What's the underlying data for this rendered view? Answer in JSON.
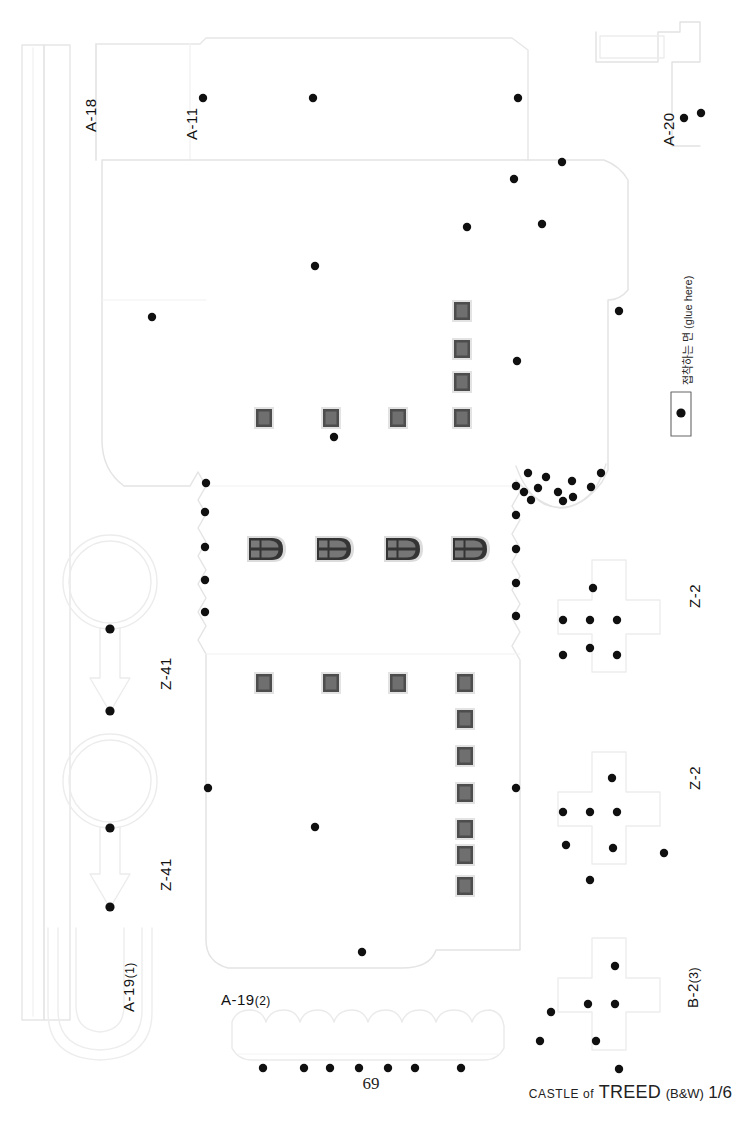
{
  "sheet": {
    "width": 742,
    "height": 1128,
    "background": "#ffffff",
    "page_number": "69"
  },
  "footer": {
    "credit_prefix": "CASTLE of",
    "credit_title": "TREED",
    "credit_variant": "(B&W)",
    "credit_sheet": "1/6"
  },
  "glue_note": {
    "text": "접착하는 면 (glue here)",
    "latin": "(glue here)"
  },
  "labels": [
    {
      "id": "a-18",
      "text": "A-18",
      "sub": "",
      "x": 74,
      "y": 108,
      "rotated": true
    },
    {
      "id": "a-11",
      "text": "A-11",
      "sub": "",
      "x": 176,
      "y": 140,
      "rotated": true
    },
    {
      "id": "a-20",
      "text": "A-20",
      "sub": "",
      "x": 655,
      "y": 142,
      "rotated": true
    },
    {
      "id": "z-41-top",
      "text": "Z-41",
      "sub": "",
      "x": 152,
      "y": 690,
      "rotated": true
    },
    {
      "id": "z-41-bot",
      "text": "Z-41",
      "sub": "",
      "x": 152,
      "y": 895,
      "rotated": true
    },
    {
      "id": "z-2-top",
      "text": "Z-2",
      "sub": "",
      "x": 682,
      "y": 608,
      "rotated": true
    },
    {
      "id": "z-2-bot",
      "text": "Z-2",
      "sub": "",
      "x": 682,
      "y": 790,
      "rotated": true
    },
    {
      "id": "b-2-3",
      "text": "B-2",
      "sub": "(3)",
      "x": 680,
      "y": 1010,
      "rotated": true
    },
    {
      "id": "a-19-1",
      "text": "A-19",
      "sub": "(1)",
      "x": 116,
      "y": 1010,
      "rotated": true
    },
    {
      "id": "a-19-2",
      "text": "A-19",
      "sub": "(2)",
      "x": 221,
      "y": 1002,
      "rotated": false
    }
  ],
  "colors": {
    "cut_line": "#e8e8e8",
    "fold_line": "#f0f0f0",
    "dot": "#101010",
    "window_frame": "#e0e0e0",
    "window_border": "#4a4a4a",
    "window_fill": "#6e6e6e",
    "arch_outer": "#d8d8d8",
    "arch_body": "#3a3a3a",
    "arch_pane": "#707070",
    "glue_box_border": "#555555",
    "text": "#111111"
  },
  "pieces": [
    {
      "name": "A-18",
      "kind": "long-strip",
      "note": "tall narrow vertical strip, left edge"
    },
    {
      "name": "A-11",
      "kind": "tall-panel",
      "note": "upper tall panel with rounded top-left corner"
    },
    {
      "name": "A-20",
      "kind": "small-tab",
      "note": "small bracket tab, top right"
    },
    {
      "name": "main",
      "kind": "body-panel",
      "note": "large castle wall unroll with notched left edge and scalloped right cutout"
    },
    {
      "name": "Z-41",
      "kind": "ring-arrow",
      "note": "circle ring joined to downward arrow, two copies"
    },
    {
      "name": "Z-2",
      "kind": "cross",
      "note": "plus/cross shaped piece, two copies"
    },
    {
      "name": "B-2(3)",
      "kind": "cross",
      "note": "plus/cross shaped piece, lower right"
    },
    {
      "name": "A-19(1)",
      "kind": "u-shape",
      "note": "U shaped band, lower left"
    },
    {
      "name": "A-19(2)",
      "kind": "scallop-strip",
      "note": "horizontal scalloped crenellation strip"
    }
  ],
  "window_counts": {
    "square_windows": 17,
    "arched_windows": 4,
    "glue_dots_total": 78
  },
  "square_windows": [
    {
      "x": 462,
      "y": 300
    },
    {
      "x": 462,
      "y": 340
    },
    {
      "x": 462,
      "y": 373
    },
    {
      "x": 462,
      "y": 411
    },
    {
      "x": 262,
      "y": 411
    },
    {
      "x": 329,
      "y": 411
    },
    {
      "x": 396,
      "y": 411
    },
    {
      "x": 262,
      "y": 678
    },
    {
      "x": 329,
      "y": 678
    },
    {
      "x": 396,
      "y": 678
    },
    {
      "x": 462,
      "y": 678
    },
    {
      "x": 462,
      "y": 714
    },
    {
      "x": 462,
      "y": 752
    },
    {
      "x": 462,
      "y": 790
    },
    {
      "x": 462,
      "y": 826
    },
    {
      "x": 462,
      "y": 848
    },
    {
      "x": 462,
      "y": 884
    }
  ],
  "arched_windows": [
    {
      "x": 263,
      "y": 548
    },
    {
      "x": 331,
      "y": 548
    },
    {
      "x": 400,
      "y": 548
    },
    {
      "x": 467,
      "y": 548
    }
  ],
  "glue_dots": [
    {
      "x": 203,
      "y": 98
    },
    {
      "x": 313,
      "y": 98
    },
    {
      "x": 518,
      "y": 98
    },
    {
      "x": 684,
      "y": 118
    },
    {
      "x": 700,
      "y": 113
    },
    {
      "x": 562,
      "y": 162
    },
    {
      "x": 514,
      "y": 179
    },
    {
      "x": 467,
      "y": 227
    },
    {
      "x": 542,
      "y": 224
    },
    {
      "x": 315,
      "y": 266
    },
    {
      "x": 152,
      "y": 317
    },
    {
      "x": 517,
      "y": 361
    },
    {
      "x": 619,
      "y": 311
    },
    {
      "x": 679,
      "y": 412
    },
    {
      "x": 334,
      "y": 437
    },
    {
      "x": 528,
      "y": 473
    },
    {
      "x": 600,
      "y": 473
    },
    {
      "x": 206,
      "y": 483
    },
    {
      "x": 516,
      "y": 486
    },
    {
      "x": 546,
      "y": 478
    },
    {
      "x": 571,
      "y": 482
    },
    {
      "x": 590,
      "y": 487
    },
    {
      "x": 524,
      "y": 492
    },
    {
      "x": 557,
      "y": 492
    },
    {
      "x": 538,
      "y": 487
    },
    {
      "x": 572,
      "y": 495
    },
    {
      "x": 563,
      "y": 500
    },
    {
      "x": 530,
      "y": 499
    },
    {
      "x": 205,
      "y": 512
    },
    {
      "x": 516,
      "y": 515
    },
    {
      "x": 205,
      "y": 547
    },
    {
      "x": 516,
      "y": 549
    },
    {
      "x": 205,
      "y": 580
    },
    {
      "x": 516,
      "y": 583
    },
    {
      "x": 205,
      "y": 612
    },
    {
      "x": 516,
      "y": 616
    },
    {
      "x": 110,
      "y": 629
    },
    {
      "x": 593,
      "y": 588
    },
    {
      "x": 563,
      "y": 620
    },
    {
      "x": 617,
      "y": 620
    },
    {
      "x": 590,
      "y": 648
    },
    {
      "x": 110,
      "y": 711
    },
    {
      "x": 208,
      "y": 788
    },
    {
      "x": 516,
      "y": 788
    },
    {
      "x": 612,
      "y": 778
    },
    {
      "x": 590,
      "y": 806
    },
    {
      "x": 563,
      "y": 812
    },
    {
      "x": 617,
      "y": 812
    },
    {
      "x": 566,
      "y": 845
    },
    {
      "x": 613,
      "y": 848
    },
    {
      "x": 664,
      "y": 853
    },
    {
      "x": 315,
      "y": 827
    },
    {
      "x": 110,
      "y": 828
    },
    {
      "x": 110,
      "y": 907
    },
    {
      "x": 362,
      "y": 952
    },
    {
      "x": 615,
      "y": 966
    },
    {
      "x": 588,
      "y": 1004
    },
    {
      "x": 615,
      "y": 1004
    },
    {
      "x": 551,
      "y": 1012
    },
    {
      "x": 540,
      "y": 1041
    },
    {
      "x": 596,
      "y": 1041
    },
    {
      "x": 263,
      "y": 1068
    },
    {
      "x": 304,
      "y": 1068
    },
    {
      "x": 330,
      "y": 1068
    },
    {
      "x": 359,
      "y": 1068
    },
    {
      "x": 388,
      "y": 1068
    },
    {
      "x": 415,
      "y": 1068
    },
    {
      "x": 461,
      "y": 1068
    },
    {
      "x": 619,
      "y": 1069
    },
    {
      "x": 679,
      "y": 412
    }
  ]
}
